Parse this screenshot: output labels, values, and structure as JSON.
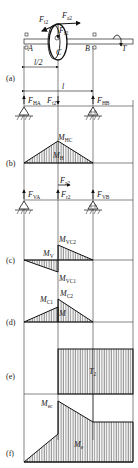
{
  "figure": {
    "panels": [
      {
        "id": "a",
        "label": "(a)"
      },
      {
        "id": "b",
        "label": "(b)"
      },
      {
        "id": "c",
        "label": "(c)"
      },
      {
        "id": "d",
        "label": "(d)"
      },
      {
        "id": "e",
        "label": "(e)"
      },
      {
        "id": "f",
        "label": "(f)"
      }
    ],
    "shaft": {
      "support_left": "A",
      "support_right": "B",
      "gear_point": "C",
      "torque": "T",
      "half_span": "l/2",
      "span": "l"
    },
    "forces_top": {
      "ft2": {
        "main": "F",
        "sub": "t2"
      },
      "fa2": {
        "main": "F",
        "sub": "a2"
      },
      "fr2": {
        "main": "F",
        "sub": "r2"
      }
    },
    "horizontal_plane": {
      "fha": {
        "main": "F",
        "sub": "HA"
      },
      "ft2": {
        "main": "F",
        "sub": "t2"
      },
      "fhb": {
        "main": "F",
        "sub": "HB"
      }
    },
    "moment_h": {
      "mhc": {
        "main": "M",
        "sub": "HC"
      },
      "mh": {
        "main": "M",
        "sub": "H"
      }
    },
    "vertical_plane": {
      "fa2": {
        "main": "F",
        "sub": "a2"
      },
      "fva": {
        "main": "F",
        "sub": "VA"
      },
      "fr2": {
        "main": "F",
        "sub": "r2"
      },
      "fvb": {
        "main": "F",
        "sub": "VB"
      }
    },
    "moment_v": {
      "mvc2": {
        "main": "M",
        "sub": "VC2"
      },
      "mv": {
        "main": "M",
        "sub": "V"
      },
      "mvc1": {
        "main": "M",
        "sub": "VC1"
      }
    },
    "moment_combined": {
      "mc2": {
        "main": "M",
        "sub": "C2"
      },
      "mc1": {
        "main": "M",
        "sub": "C1"
      },
      "m": {
        "main": "M",
        "sub": ""
      }
    },
    "torque_diagram": {
      "t2": {
        "main": "T",
        "sub": "2"
      }
    },
    "equivalent_moment": {
      "mec": {
        "main": "M",
        "sub": "ec"
      },
      "me": {
        "main": "M",
        "sub": "e"
      }
    }
  }
}
